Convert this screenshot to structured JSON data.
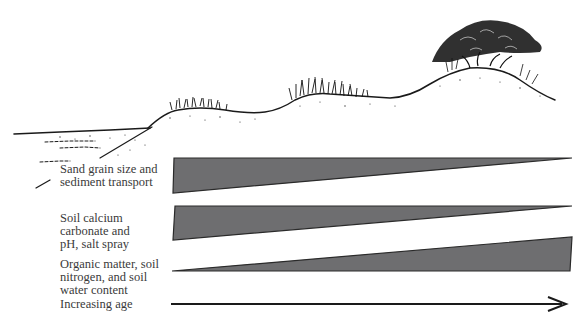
{
  "diagram": {
    "illustration": {
      "description": "Cross-section of a coastal dune profile from beach to vegetated back dune",
      "zones": [
        "beach-shoreline",
        "foredune-grass",
        "middle-dune-grass",
        "back-dune-tree-shrub"
      ]
    },
    "gradients": [
      {
        "label": "Sand grain size and\nsediment transport",
        "trend": "decreasing",
        "shape": "wedge-narrowing-right"
      },
      {
        "label": "Soil calcium\ncarbonate and\npH, salt spray",
        "trend": "decreasing",
        "shape": "wedge-narrowing-right"
      },
      {
        "label": "Organic matter, soil\nnitrogen, and soil\nwater content",
        "trend": "increasing",
        "shape": "wedge-widening-right"
      }
    ],
    "arrow": {
      "label": "Increasing age",
      "direction": "right"
    },
    "colors": {
      "wedge_fill": "#6e6e70",
      "wedge_stroke": "#2a2a2a",
      "ink": "#1a1a1a",
      "text": "#3a3a3a"
    }
  }
}
